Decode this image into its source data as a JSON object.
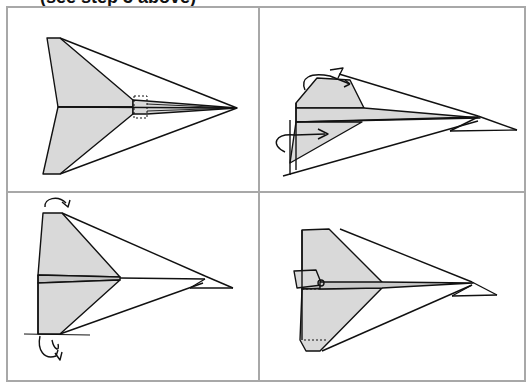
{
  "header": {
    "caption": "(see step 3 above)"
  },
  "panels": [
    {
      "id": 1,
      "description": "Folded paper airplane, top view, with dashed tab region near fuselage"
    },
    {
      "id": 2,
      "description": "Wing tips folded upward with fold arrows"
    },
    {
      "id": 3,
      "description": "Wings folded down along lines, curved arrows at top and bottom"
    },
    {
      "id": 4,
      "description": "Finished paper airplane with tail fin"
    }
  ],
  "colors": {
    "border": "#a8a8a8",
    "line": "#111111",
    "fill": "#d9d9d9",
    "background": "#ffffff"
  }
}
